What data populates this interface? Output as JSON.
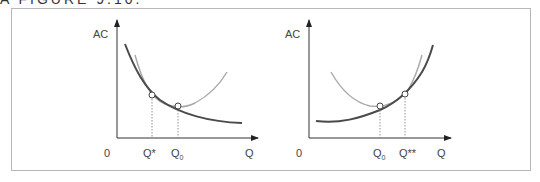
{
  "header": {
    "cut_off_text": "A FIGURE 9.10."
  },
  "colors": {
    "dark_curve": "#4a4a4a",
    "light_curve": "#a8a8a8",
    "axis": "#333333",
    "frame": "#b8b8b8",
    "text": "#444444"
  },
  "diagram": {
    "left_panel": {
      "y_axis_label": "AC",
      "x_axis_label": "Q",
      "origin_label": "0",
      "points": [
        {
          "label": "Q*",
          "description": "tangency of short-run and long-run AC"
        },
        {
          "label": "Q0",
          "sub": "0",
          "base": "Q",
          "description": "minimum of short-run AC"
        }
      ],
      "curves": [
        {
          "name": "long-run AC",
          "style": "dark",
          "shape": "downward sloping"
        },
        {
          "name": "short-run AC",
          "style": "light",
          "shape": "U-shaped"
        }
      ]
    },
    "right_panel": {
      "y_axis_label": "AC",
      "x_axis_label": "Q",
      "origin_label": "0",
      "points": [
        {
          "label": "Q0",
          "sub": "0",
          "base": "Q",
          "description": "minimum of short-run AC"
        },
        {
          "label": "Q**",
          "description": "tangency of short-run and long-run AC"
        }
      ],
      "curves": [
        {
          "name": "long-run AC",
          "style": "dark",
          "shape": "upward sloping"
        },
        {
          "name": "short-run AC",
          "style": "light",
          "shape": "U-shaped"
        }
      ]
    }
  }
}
